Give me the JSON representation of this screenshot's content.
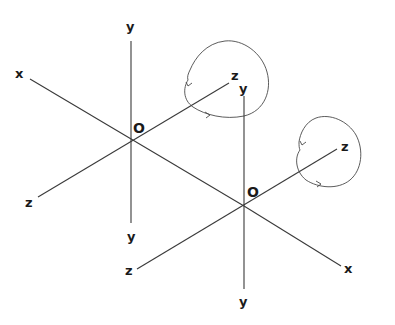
{
  "diagram": {
    "systems": [
      {
        "id": "frame-1",
        "origin_label": "O",
        "axis_labels": {
          "x_pos": "x",
          "y_pos": "y",
          "y_neg": "y",
          "z_pos": "z",
          "z_neg": "z"
        },
        "rotation_indicator": "circle around z axis with arrowheads"
      },
      {
        "id": "frame-2",
        "origin_label": "O",
        "axis_labels": {
          "x_pos": "x",
          "y_pos": "y",
          "y_neg": "y",
          "z_pos": "z",
          "z_neg": "z"
        },
        "rotation_indicator": "circle around z axis with arrowheads"
      }
    ]
  }
}
